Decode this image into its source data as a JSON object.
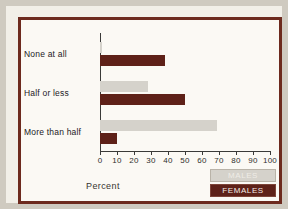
{
  "figure": {
    "frame_color": "#6d2a1e",
    "background_color": "#fbf9f4",
    "males_color": "#d5d2cb",
    "females_color": "#5e2118"
  },
  "chart_data": {
    "type": "bar",
    "orientation": "horizontal",
    "title": "",
    "xlabel": "Percent",
    "ylabel": "",
    "xlim": [
      0,
      100
    ],
    "xticks": [
      0,
      10,
      20,
      30,
      40,
      50,
      60,
      70,
      80,
      90,
      100
    ],
    "xticklabels": [
      "0",
      "10",
      "20",
      "30",
      "40",
      "50",
      "60",
      "70",
      "80",
      "90",
      "100"
    ],
    "grid": false,
    "legend_position": "bottom-right",
    "categories": [
      "None at all",
      "Half or less",
      "More than half"
    ],
    "series": [
      {
        "name": "MALES",
        "color": "#d5d2cb",
        "values": [
          1,
          28,
          69
        ]
      },
      {
        "name": "FEMALES",
        "color": "#5e2118",
        "values": [
          38,
          50,
          10
        ]
      }
    ]
  },
  "legend": {
    "items": [
      {
        "label": "MALES"
      },
      {
        "label": "FEMALES"
      }
    ]
  }
}
